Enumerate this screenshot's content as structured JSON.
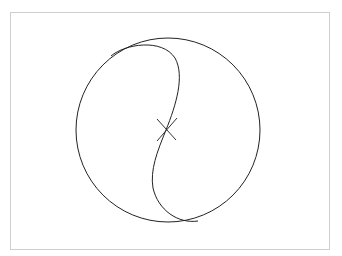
{
  "figure": {
    "type": "geometric-diagram",
    "frame": {
      "x": 10,
      "y": 12,
      "width": 320,
      "height": 238,
      "border_color": "#cfcfcf"
    },
    "circle": {
      "cx": 168,
      "cy": 130,
      "r": 92,
      "stroke": "#222222"
    },
    "s_curve": {
      "stroke": "#222222",
      "start": [
        111,
        56
      ],
      "center": [
        166,
        130
      ],
      "end": [
        198,
        221
      ]
    },
    "center_mark": {
      "x": 166,
      "y": 130,
      "size": 10,
      "stroke": "#222222",
      "symbol": "X"
    }
  }
}
